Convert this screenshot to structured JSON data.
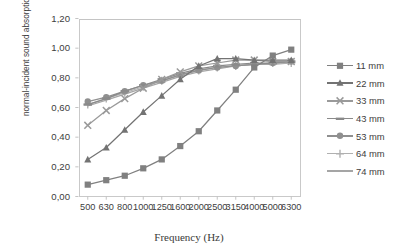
{
  "chart_data": {
    "type": "line",
    "title": "",
    "xlabel": "Frequency (Hz)",
    "ylabel": "normal-incident sound absorption coefficient",
    "categories": [
      "500",
      "630",
      "800",
      "1000",
      "1250",
      "1600",
      "2000",
      "2500",
      "3150",
      "4000",
      "5000",
      "6300"
    ],
    "ylim": [
      0.0,
      1.2
    ],
    "ytick_labels": [
      "0,00",
      "0,20",
      "0,40",
      "0,60",
      "0,80",
      "1,00",
      "1,20"
    ],
    "ytick_values": [
      0.0,
      0.2,
      0.4,
      0.6,
      0.8,
      1.0,
      1.2
    ],
    "grid": false,
    "legend_position": "right",
    "decimal_separator": ",",
    "series": [
      {
        "name": "11 mm",
        "marker": "square",
        "color": "#808080",
        "values": [
          0.08,
          0.11,
          0.14,
          0.19,
          0.25,
          0.34,
          0.44,
          0.58,
          0.72,
          0.87,
          0.95,
          0.99
        ]
      },
      {
        "name": "22 mm",
        "marker": "triangle",
        "color": "#737373",
        "values": [
          0.25,
          0.33,
          0.45,
          0.57,
          0.68,
          0.79,
          0.88,
          0.93,
          0.93,
          0.92,
          0.92,
          0.92
        ]
      },
      {
        "name": "33 mm",
        "marker": "cross",
        "color": "#9a9a9a",
        "values": [
          0.48,
          0.58,
          0.66,
          0.73,
          0.79,
          0.84,
          0.88,
          0.9,
          0.92,
          0.92,
          0.91,
          0.91
        ]
      },
      {
        "name": "43 mm",
        "marker": "dash",
        "color": "#8a8a8a",
        "values": [
          0.62,
          0.66,
          0.71,
          0.75,
          0.79,
          0.83,
          0.86,
          0.88,
          0.89,
          0.9,
          0.9,
          0.91
        ]
      },
      {
        "name": "53 mm",
        "marker": "circle",
        "color": "#8f8f8f",
        "values": [
          0.64,
          0.67,
          0.71,
          0.75,
          0.78,
          0.82,
          0.85,
          0.87,
          0.88,
          0.89,
          0.9,
          0.91
        ]
      },
      {
        "name": "64 mm",
        "marker": "plus",
        "color": "#b0b0b0",
        "values": [
          0.62,
          0.66,
          0.7,
          0.74,
          0.78,
          0.82,
          0.85,
          0.87,
          0.88,
          0.89,
          0.9,
          0.9
        ]
      },
      {
        "name": "74 mm",
        "marker": "line",
        "color": "#a5a5a5",
        "values": [
          0.61,
          0.65,
          0.69,
          0.73,
          0.77,
          0.81,
          0.84,
          0.86,
          0.88,
          0.89,
          0.89,
          0.9
        ]
      }
    ]
  }
}
